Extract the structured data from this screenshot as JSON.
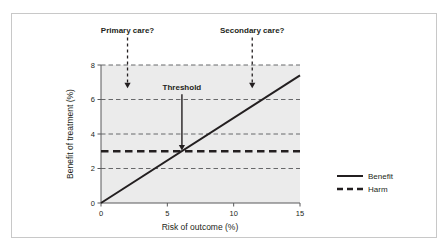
{
  "chart_data": {
    "type": "line",
    "title": "",
    "xlabel": "Risk of outcome (%)",
    "ylabel": "Benefit of treatment (%)",
    "xlim": [
      0,
      15
    ],
    "ylim": [
      0,
      8
    ],
    "xticks": [
      "0",
      "5",
      "10",
      "15"
    ],
    "xtick_values": [
      0,
      5,
      10,
      15
    ],
    "yticks": [
      "0",
      "2",
      "4",
      "6",
      "8"
    ],
    "ytick_values": [
      0,
      2,
      4,
      6,
      8
    ],
    "grid": "horizontal-dashed",
    "legend_position": "right",
    "plot_background": "#ebebeb",
    "line_color": "#231f20",
    "series": [
      {
        "name": "Benefit",
        "style": "solid",
        "x": [
          0,
          15
        ],
        "values": [
          0,
          7.4
        ]
      },
      {
        "name": "Harm",
        "style": "dashed",
        "x": [
          0,
          15
        ],
        "values": [
          3,
          3
        ]
      }
    ],
    "annotations": [
      {
        "label": "Primary care?",
        "x": 2.0,
        "arrow": "dashed",
        "arrow_from_y": 9.6,
        "arrow_to_y": 6.65
      },
      {
        "label": "Secondary care?",
        "x": 11.4,
        "arrow": "dashed",
        "arrow_from_y": 9.6,
        "arrow_to_y": 6.65
      },
      {
        "label": "Threshold",
        "x": 6.1,
        "arrow": "solid",
        "arrow_from_y": 6.3,
        "arrow_to_y": 3.05
      }
    ]
  },
  "legend": {
    "items": [
      {
        "label": "Benefit",
        "style": "solid"
      },
      {
        "label": "Harm",
        "style": "dashed"
      }
    ]
  }
}
